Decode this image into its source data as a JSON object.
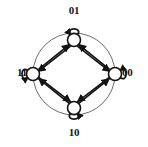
{
  "figure": {
    "kind": "state-transition-diagram",
    "title": "",
    "background_color": "#ffffff",
    "ink_color": "#141414",
    "ring_color": "#5a5a5a"
  },
  "nodes": [
    {
      "id": "01",
      "label": "01",
      "position": "top",
      "cx": 74,
      "cy": 40,
      "r": 7,
      "self_loop": {
        "present": true,
        "direction": "up",
        "arrow": "clockwise"
      }
    },
    {
      "id": "11",
      "label": "11",
      "position": "left",
      "cx": 33,
      "cy": 74,
      "r": 7,
      "self_loop": {
        "present": true,
        "direction": "left",
        "arrow": "clockwise"
      }
    },
    {
      "id": "00",
      "label": "00",
      "position": "right",
      "cx": 115,
      "cy": 74,
      "r": 7,
      "self_loop": {
        "present": true,
        "direction": "right",
        "arrow": "clockwise"
      }
    },
    {
      "id": "10",
      "label": "10",
      "position": "bottom",
      "cx": 74,
      "cy": 108,
      "r": 7,
      "self_loop": {
        "present": true,
        "direction": "down",
        "arrow": "clockwise"
      }
    }
  ],
  "edges": [
    {
      "from": "00",
      "to": "01",
      "style": "straight",
      "arrowhead": "at-target"
    },
    {
      "from": "11",
      "to": "01",
      "style": "straight",
      "arrowhead": "at-target"
    },
    {
      "from": "01",
      "to": "11",
      "style": "straight",
      "arrowhead": "at-target"
    },
    {
      "from": "10",
      "to": "11",
      "style": "straight",
      "arrowhead": "at-target"
    },
    {
      "from": "01",
      "to": "00",
      "style": "straight",
      "arrowhead": "at-target"
    },
    {
      "from": "10",
      "to": "00",
      "style": "straight",
      "arrowhead": "at-target"
    },
    {
      "from": "00",
      "to": "10",
      "style": "straight",
      "arrowhead": "at-target"
    },
    {
      "from": "11",
      "to": "10",
      "style": "straight",
      "arrowhead": "at-target"
    }
  ],
  "self_loops": [
    {
      "node": "01",
      "label": ""
    },
    {
      "node": "11",
      "label": ""
    },
    {
      "node": "00",
      "label": ""
    },
    {
      "node": "10",
      "label": ""
    }
  ],
  "decoration": {
    "circumscribed_circle": {
      "present": true,
      "cx": 74,
      "cy": 74,
      "r": 41,
      "stroke": "#6b6b6b"
    }
  }
}
